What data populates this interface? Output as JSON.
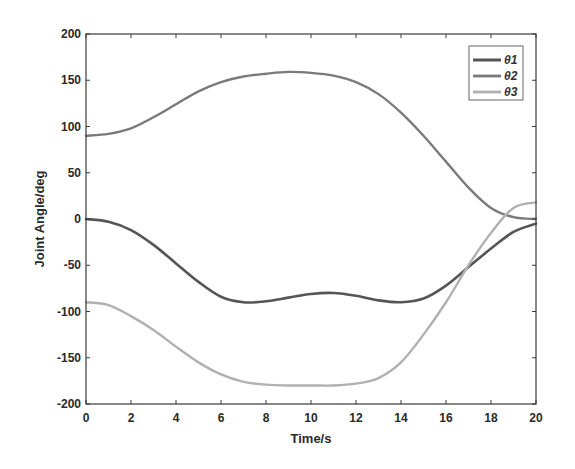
{
  "chart_data": {
    "type": "line",
    "title": "",
    "xlabel": "Time/s",
    "ylabel": "Joint Angle/deg",
    "xlim": [
      0,
      20
    ],
    "ylim": [
      -200,
      200
    ],
    "xticks": [
      0,
      2,
      4,
      6,
      8,
      10,
      12,
      14,
      16,
      18,
      20
    ],
    "yticks": [
      -200,
      -150,
      -100,
      -50,
      0,
      50,
      100,
      150,
      200
    ],
    "grid": false,
    "legend_position": "upper right",
    "x": [
      0,
      1,
      2,
      3,
      4,
      5,
      6,
      7,
      8,
      9,
      10,
      11,
      12,
      13,
      14,
      15,
      16,
      17,
      18,
      19,
      20
    ],
    "series": [
      {
        "name": "θ1",
        "color": "#555555",
        "width": 2.6,
        "values": [
          0,
          -3,
          -12,
          -28,
          -48,
          -68,
          -84,
          -90,
          -89,
          -85,
          -81,
          -80,
          -83,
          -88,
          -90,
          -86,
          -72,
          -52,
          -32,
          -14,
          -5
        ]
      },
      {
        "name": "θ2",
        "color": "#7a7a7a",
        "width": 2.4,
        "values": [
          90,
          92,
          98,
          110,
          124,
          138,
          148,
          154,
          157,
          159,
          158,
          155,
          148,
          135,
          115,
          90,
          62,
          34,
          12,
          2,
          0
        ]
      },
      {
        "name": "θ3",
        "color": "#b0b0b0",
        "width": 2.4,
        "values": [
          -90,
          -93,
          -105,
          -120,
          -138,
          -155,
          -168,
          -176,
          -179,
          -180,
          -180,
          -180,
          -178,
          -172,
          -155,
          -125,
          -90,
          -50,
          -15,
          12,
          18
        ]
      }
    ]
  }
}
